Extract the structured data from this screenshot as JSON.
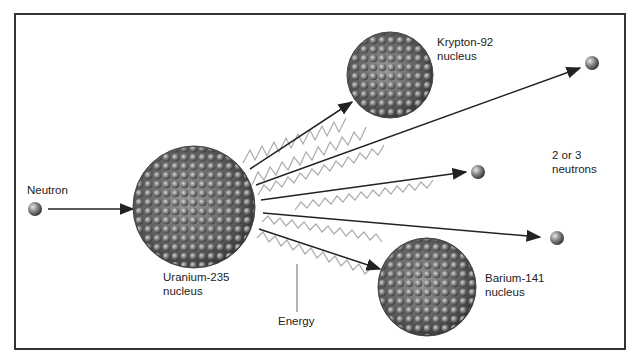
{
  "diagram": {
    "type": "nuclear fission",
    "labels": {
      "neutron": "Neutron",
      "uranium_1": "Uranium-235",
      "uranium_2": "nucleus",
      "krypton_1": "Krypton-92",
      "krypton_2": "nucleus",
      "barium_1": "Barium-141",
      "barium_2": "nucleus",
      "neutrons_1": "2 or 3",
      "neutrons_2": "neutrons",
      "energy": "Energy"
    },
    "colors": {
      "frame": "#333333",
      "arrow": "#222222",
      "wave": "#aaaaaa",
      "nucleon": "#777777"
    }
  }
}
